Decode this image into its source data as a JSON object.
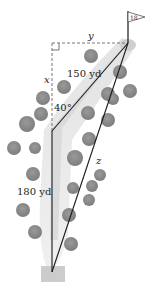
{
  "diagram": {
    "type": "golf-hole-geometry",
    "flag": {
      "label": "18"
    },
    "labels": {
      "y": "y",
      "x": "x",
      "z": "z",
      "segment_to_pin": "150 yd",
      "segment_from_tee": "180 yd",
      "angle": "40°"
    },
    "colors": {
      "fairway": "#d9d9d9",
      "bush": "#8a8a8a",
      "line": "#1a1a1a",
      "dashed": "#777777",
      "tee": "#c8c8c8"
    },
    "bushes": [
      {
        "cx": 91,
        "cy": 56,
        "r": 7
      },
      {
        "cx": 64,
        "cy": 87,
        "r": 7
      },
      {
        "cx": 43,
        "cy": 98,
        "r": 7
      },
      {
        "cx": 41,
        "cy": 114,
        "r": 7
      },
      {
        "cx": 27,
        "cy": 124,
        "r": 8
      },
      {
        "cx": 14,
        "cy": 148,
        "r": 7
      },
      {
        "cx": 35,
        "cy": 148,
        "r": 6
      },
      {
        "cx": 33,
        "cy": 174,
        "r": 7
      },
      {
        "cx": 23,
        "cy": 210,
        "r": 7
      },
      {
        "cx": 35,
        "cy": 232,
        "r": 7
      },
      {
        "cx": 120,
        "cy": 72,
        "r": 7
      },
      {
        "cx": 130,
        "cy": 91,
        "r": 7
      },
      {
        "cx": 108,
        "cy": 94,
        "r": 7
      },
      {
        "cx": 113,
        "cy": 99,
        "r": 6
      },
      {
        "cx": 88,
        "cy": 113,
        "r": 7
      },
      {
        "cx": 108,
        "cy": 120,
        "r": 7
      },
      {
        "cx": 89,
        "cy": 139,
        "r": 7
      },
      {
        "cx": 75,
        "cy": 158,
        "r": 8
      },
      {
        "cx": 100,
        "cy": 175,
        "r": 6
      },
      {
        "cx": 92,
        "cy": 186,
        "r": 6
      },
      {
        "cx": 73,
        "cy": 188,
        "r": 6
      },
      {
        "cx": 89,
        "cy": 200,
        "r": 6
      },
      {
        "cx": 69,
        "cy": 215,
        "r": 7
      },
      {
        "cx": 71,
        "cy": 244,
        "r": 7
      }
    ]
  }
}
